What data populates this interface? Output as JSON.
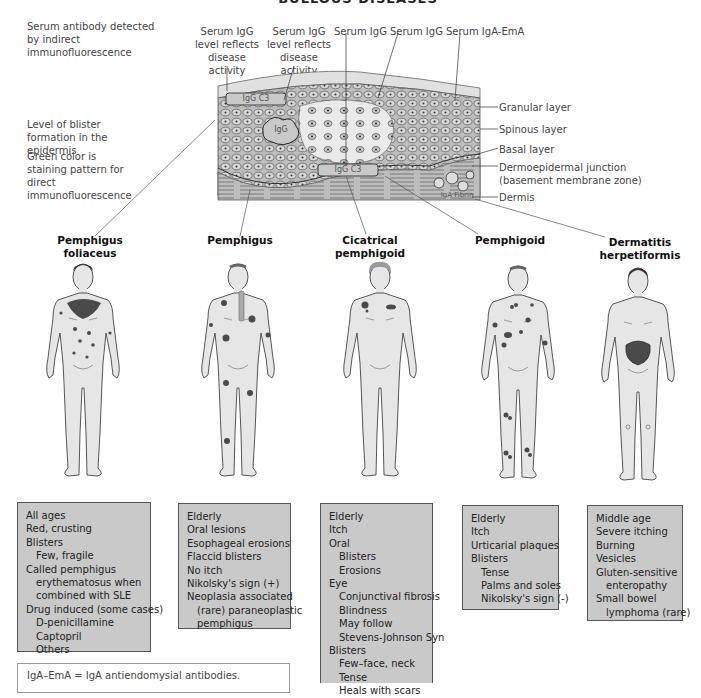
{
  "figure": {
    "title": "Bullous diseases",
    "side_notes": [
      "Serum antibody detected by indirect immunofluorescence",
      "Level of blister formation in the epidermis",
      "Green color is staining pattern for direct immunofluorescence"
    ],
    "top_labels": [
      "Serum IgG level reflects disease activity",
      "Serum IgG level reflects disease activity",
      "Serum IgG",
      "Serum IgG",
      "Serum IgA-EmA"
    ],
    "skin_layers": [
      "Granular layer",
      "Spinous layer",
      "Basal layer",
      "Dermoepidermal junction (basement membrane zone)",
      "Dermis"
    ],
    "deposit_labels": {
      "upper": "IgG C3",
      "intercellular": "IgG",
      "basement": "IgG C3",
      "dermal": "IgA Fibrin"
    },
    "colors": {
      "box_fill": "#c9c9c9",
      "box_border": "#555555",
      "skin_fill": "#e6e6e6",
      "lesion": "#4a4a4a",
      "tissue": "#bdbdbd"
    },
    "diseases": [
      {
        "name": "Pemphigus foliaceus",
        "lines": [
          {
            "t": "All ages",
            "i": 0
          },
          {
            "t": "Red, crusting",
            "i": 0
          },
          {
            "t": "Blisters",
            "i": 0
          },
          {
            "t": "Few, fragile",
            "i": 1
          },
          {
            "t": "Called pemphigus",
            "i": 0
          },
          {
            "t": "erythematosus when",
            "i": 1
          },
          {
            "t": "combined with SLE",
            "i": 1
          },
          {
            "t": "Drug induced (some cases)",
            "i": 0
          },
          {
            "t": "D-penicillamine",
            "i": 1
          },
          {
            "t": "Captopril",
            "i": 1
          },
          {
            "t": "Others",
            "i": 1
          }
        ]
      },
      {
        "name": "Pemphigus",
        "lines": [
          {
            "t": "Elderly",
            "i": 0
          },
          {
            "t": "Oral lesions",
            "i": 0
          },
          {
            "t": "Esophageal erosions",
            "i": 0
          },
          {
            "t": "Flaccid blisters",
            "i": 0
          },
          {
            "t": "No itch",
            "i": 0
          },
          {
            "t": "Nikolsky's sign (+)",
            "i": 0
          },
          {
            "t": "Neoplasia associated",
            "i": 0
          },
          {
            "t": "(rare) paraneoplastic",
            "i": 1
          },
          {
            "t": "pemphigus",
            "i": 1
          }
        ]
      },
      {
        "name": "Cicatrical pemphigoid",
        "lines": [
          {
            "t": "Elderly",
            "i": 0
          },
          {
            "t": "Itch",
            "i": 0
          },
          {
            "t": "Oral",
            "i": 0
          },
          {
            "t": "Blisters",
            "i": 1
          },
          {
            "t": "Erosions",
            "i": 1
          },
          {
            "t": "Eye",
            "i": 0
          },
          {
            "t": "Conjunctival fibrosis",
            "i": 1
          },
          {
            "t": "Blindness",
            "i": 1
          },
          {
            "t": "May follow",
            "i": 1
          },
          {
            "t": "Stevens-Johnson Syn",
            "i": 1
          },
          {
            "t": "Blisters",
            "i": 0
          },
          {
            "t": "Few–face, neck",
            "i": 1
          },
          {
            "t": "Tense",
            "i": 1
          },
          {
            "t": "Heals with scars",
            "i": 1
          }
        ]
      },
      {
        "name": "Pemphigoid",
        "lines": [
          {
            "t": "Elderly",
            "i": 0
          },
          {
            "t": "Itch",
            "i": 0
          },
          {
            "t": "Urticarial plaques",
            "i": 0
          },
          {
            "t": "Blisters",
            "i": 0
          },
          {
            "t": "Tense",
            "i": 1
          },
          {
            "t": "Palms and soles",
            "i": 1
          },
          {
            "t": "Nikolsky's sign (-)",
            "i": 1
          }
        ]
      },
      {
        "name": "Dermatitis herpetiformis",
        "lines": [
          {
            "t": "Middle age",
            "i": 0
          },
          {
            "t": "Severe itching",
            "i": 0
          },
          {
            "t": "Burning",
            "i": 0
          },
          {
            "t": "Vesicles",
            "i": 0
          },
          {
            "t": "Gluten-sensitive",
            "i": 0
          },
          {
            "t": "enteropathy",
            "i": 1
          },
          {
            "t": "Small bowel",
            "i": 0
          },
          {
            "t": "lymphoma (rare)",
            "i": 1
          }
        ]
      }
    ],
    "legend": "IgA–EmA = IgA antiendomysial antibodies."
  }
}
